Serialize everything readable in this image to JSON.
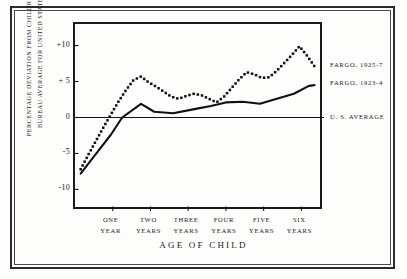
{
  "chart_data": {
    "type": "line",
    "title": "",
    "xlabel": "AGE OF CHILD",
    "ylabel_line1": "PERCENTAGE DEVIATION FROM CHILDREN'S",
    "ylabel_line2": "BUREAU AVERAGE FOR UNITED STATES",
    "ylim": [
      -13,
      13
    ],
    "xlim": [
      0,
      6.6
    ],
    "grid": false,
    "legend_position": "right",
    "y_ticks": [
      {
        "value": 10,
        "label": "+10"
      },
      {
        "value": 5,
        "label": "+ 5"
      },
      {
        "value": 0,
        "label": "0"
      },
      {
        "value": -5,
        "label": "-5"
      },
      {
        "value": -10,
        "label": "-10"
      }
    ],
    "x_ticks": [
      {
        "value": 1,
        "line1": "ONE",
        "line2": "YEAR"
      },
      {
        "value": 2,
        "line1": "TWO",
        "line2": "YEARS"
      },
      {
        "value": 3,
        "line1": "THREE",
        "line2": "YEARS"
      },
      {
        "value": 4,
        "line1": "FOUR",
        "line2": "YEARS"
      },
      {
        "value": 5,
        "line1": "FIVE",
        "line2": "YEARS"
      },
      {
        "value": 6,
        "line1": "SIX",
        "line2": "YEARS"
      }
    ],
    "series": [
      {
        "name": "FARGO, 1925-7",
        "style": "dotted",
        "color": "#111111",
        "label_y": 7.2,
        "x": [
          0.15,
          0.35,
          0.55,
          0.75,
          0.95,
          1.15,
          1.35,
          1.55,
          1.75,
          1.95,
          2.15,
          2.35,
          2.55,
          2.75,
          2.95,
          3.15,
          3.35,
          3.55,
          3.75,
          3.95,
          4.15,
          4.35,
          4.55,
          4.75,
          4.95,
          5.15,
          5.35,
          5.55,
          5.75,
          5.95,
          6.15,
          6.35
        ],
        "values": [
          -7.2,
          -5.2,
          -3.3,
          -1.4,
          0.4,
          2.2,
          3.8,
          5.2,
          5.7,
          4.9,
          4.3,
          3.6,
          2.9,
          2.6,
          3.0,
          3.3,
          3.1,
          2.6,
          2.1,
          2.9,
          4.1,
          5.3,
          6.3,
          6.0,
          5.5,
          5.6,
          6.5,
          7.6,
          8.7,
          9.9,
          8.6,
          7.1
        ]
      },
      {
        "name": "FARGO, 1923-4",
        "style": "solid",
        "color": "#111111",
        "label_y": 4.6,
        "x": [
          0.15,
          0.55,
          0.95,
          1.25,
          1.75,
          2.1,
          2.6,
          3.2,
          3.6,
          4.0,
          4.45,
          4.9,
          5.35,
          5.8,
          6.2,
          6.35
        ],
        "values": [
          -7.8,
          -5.1,
          -2.4,
          0.0,
          1.9,
          0.8,
          0.6,
          1.2,
          1.6,
          2.1,
          2.2,
          1.9,
          2.6,
          3.3,
          4.4,
          4.5
        ]
      },
      {
        "name": "U. S. AVERAGE",
        "style": "baseline",
        "color": "#111111",
        "label_y": 0,
        "x": [
          0,
          6.6
        ],
        "values": [
          0,
          0
        ]
      }
    ],
    "annotations": []
  }
}
